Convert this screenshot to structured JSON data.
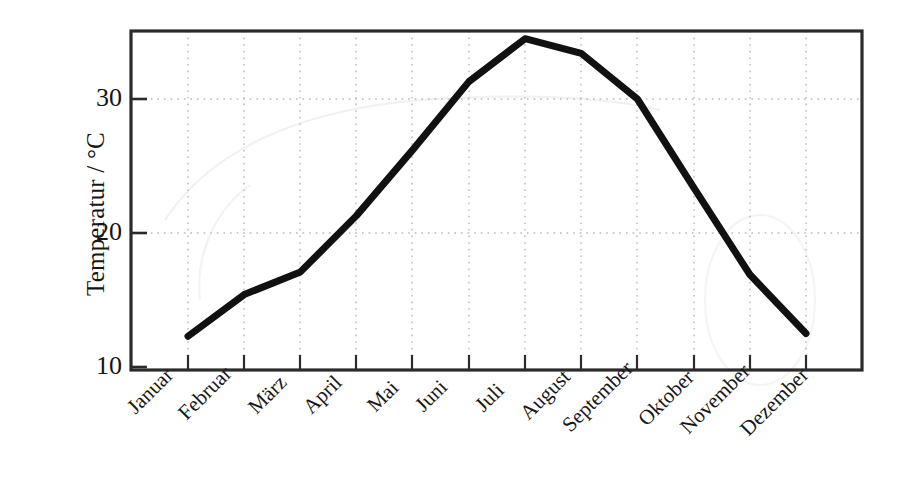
{
  "chart_data": {
    "type": "line",
    "title": "",
    "subtitle": "",
    "xlabel": "",
    "ylabel": "Temperatur / °C",
    "categories": [
      "Januar",
      "Februar",
      "März",
      "April",
      "Mai",
      "Juni",
      "Juli",
      "August",
      "September",
      "Oktober",
      "November",
      "Dezember"
    ],
    "values": [
      12.3,
      15.4,
      17.1,
      21.3,
      26.2,
      31.3,
      34.5,
      33.4,
      30.0,
      23.4,
      16.9,
      12.5
    ],
    "series": [
      {
        "name": "Temperatur",
        "values": [
          12.3,
          15.4,
          17.1,
          21.3,
          26.2,
          31.3,
          34.5,
          33.4,
          30.0,
          23.4,
          16.9,
          12.5
        ]
      }
    ],
    "ylim": [
      10,
      35.2
    ],
    "y_ticks": [
      10,
      20,
      30
    ],
    "y_tick_labels": [
      "10",
      "20",
      "30"
    ],
    "x_ticks": [
      "Januar",
      "Februar",
      "März",
      "April",
      "Mai",
      "Juni",
      "Juli",
      "August",
      "September",
      "Oktober",
      "November",
      "Dezember"
    ],
    "grid": "dotted-both",
    "legend": "none",
    "line_color": "#111111",
    "line_width_px": 7,
    "axis_color": "#2b2b2b",
    "grid_color": "#bdbdbd",
    "background_color": "#ffffff"
  },
  "axis": {
    "y_title": "Temperatur / °C",
    "y_tick_0": "10",
    "y_tick_1": "20",
    "y_tick_2": "30"
  },
  "x_labels": {
    "m0": "Januar",
    "m1": "Februar",
    "m2": "März",
    "m3": "April",
    "m4": "Mai",
    "m5": "Juni",
    "m6": "Juli",
    "m7": "August",
    "m8": "September",
    "m9": "Oktober",
    "m10": "November",
    "m11": "Dezember"
  }
}
